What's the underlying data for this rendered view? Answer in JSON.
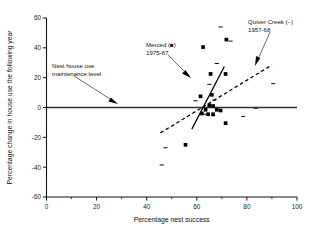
{
  "chart_data": {
    "type": "scatter",
    "title": "",
    "xlabel": "Percentage nest success",
    "ylabel": "Percentage change in house use the following year",
    "xlim": [
      0,
      100
    ],
    "ylim": [
      -60,
      60
    ],
    "xticks": [
      0,
      20,
      40,
      60,
      80,
      100
    ],
    "xticklabels": [
      "0",
      "20",
      "40",
      "60",
      "80",
      "100"
    ],
    "xminorticks": [
      10,
      30,
      50,
      70,
      90
    ],
    "yticks": [
      -60,
      -40,
      -20,
      0,
      20,
      40,
      60
    ],
    "yticklabels": [
      "-60",
      "-40",
      "-20",
      "0",
      "20",
      "40",
      "60"
    ],
    "grid": false,
    "legend": "annotations",
    "series": [
      {
        "name": "Merced",
        "label": "Merced (■)",
        "period": "1975-87",
        "marker": "filled-square",
        "color": "#000000",
        "points": [
          [
            62.5,
            40.5
          ],
          [
            71.8,
            45.5
          ],
          [
            65.5,
            22.5
          ],
          [
            71.5,
            22.5
          ],
          [
            66.0,
            8.5
          ],
          [
            61.5,
            7.5
          ],
          [
            65.0,
            1.5
          ],
          [
            66.5,
            1.0
          ],
          [
            63.5,
            -1.5
          ],
          [
            68.0,
            -1.5
          ],
          [
            69.5,
            -2.0
          ],
          [
            62.0,
            -4.0
          ],
          [
            64.5,
            -4.5
          ],
          [
            66.5,
            -4.5
          ],
          [
            71.5,
            -10.5
          ],
          [
            55.5,
            -25.0
          ]
        ]
      },
      {
        "name": "Quiver Creek",
        "label": "Quiver Creek (–)",
        "period": "1957-68",
        "marker": "short-dash",
        "color": "#000000",
        "points": [
          [
            69.5,
            54.0
          ],
          [
            73.5,
            44.5
          ],
          [
            68.0,
            29.5
          ],
          [
            90.5,
            16.0
          ],
          [
            65.0,
            15.5
          ],
          [
            67.0,
            5.0
          ],
          [
            59.5,
            4.5
          ],
          [
            63.0,
            -4.5
          ],
          [
            66.5,
            -5.5
          ],
          [
            78.5,
            -6.0
          ],
          [
            83.5,
            -0.5
          ],
          [
            47.5,
            -27.0
          ],
          [
            46.0,
            -38.5
          ]
        ]
      }
    ],
    "fit_lines": [
      {
        "name": "merced-fit",
        "style": "solid",
        "x_start": 58.0,
        "y_start": -14.5,
        "x_end": 71.0,
        "y_end": 27.5
      },
      {
        "name": "quiver-creek-fit",
        "style": "dashed",
        "x_start": 45.5,
        "y_start": -17.0,
        "x_end": 90.0,
        "y_end": 28.5
      }
    ],
    "reference_lines": [
      {
        "name": "maintenance-level",
        "orientation": "horizontal",
        "value": 0,
        "style": "solid",
        "label": "Nest house use maintenance level"
      }
    ],
    "annotations": [
      {
        "id": "maintenance-annotation",
        "lines": [
          "Nest house use",
          "maintenance level"
        ],
        "text_x": 52,
        "text_y": 68,
        "arrow_to_x": 118,
        "arrow_to_y": 104
      },
      {
        "id": "merced-annotation",
        "lines": [
          "Merced (■)",
          "1975-87"
        ],
        "text_x": 146,
        "text_y": 47,
        "arrow_to_x": 191,
        "arrow_to_y": 78
      },
      {
        "id": "quiver-annotation",
        "lines": [
          "Quiver Creek (–)",
          "1957-68"
        ],
        "text_x": 248,
        "text_y": 24,
        "arrow_to_x": 255,
        "arrow_to_y": 66
      }
    ]
  }
}
